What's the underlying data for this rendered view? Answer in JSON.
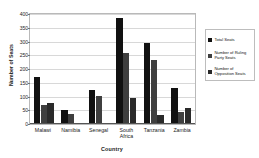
{
  "chart_data": {
    "type": "bar",
    "title": "",
    "xlabel": "Country",
    "ylabel": "Number of Seats",
    "categories": [
      "Malawi",
      "Namibia",
      "Senegal",
      "South Africa",
      "Tanzania",
      "Zambia"
    ],
    "series": [
      {
        "name": "Total Seats",
        "color": "#111111",
        "values": [
          170,
          50,
          122,
          385,
          295,
          130
        ]
      },
      {
        "name": "Number of Ruling Party Seats",
        "color": "#3f3f3f",
        "values": [
          70,
          35,
          102,
          260,
          232,
          45
        ]
      },
      {
        "name": "Number of Opposition Seats",
        "color": "#2a2a2a",
        "values": [
          78,
          5,
          2,
          93,
          32,
          60
        ]
      }
    ],
    "ylim": [
      0,
      400
    ],
    "yticks": [
      0,
      50,
      100,
      150,
      200,
      250,
      300,
      350,
      400
    ],
    "grid": true,
    "legend_position": "right"
  },
  "legend": {
    "entries": [
      "Total Seats",
      "Number of Ruling Party Seats",
      "Number of Opposition Seats"
    ]
  }
}
